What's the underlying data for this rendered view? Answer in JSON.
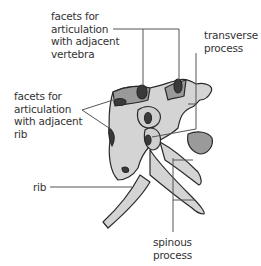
{
  "diagram": {
    "colors": {
      "bone_light": "#d4d4d4",
      "bone_mid": "#9a9a9a",
      "facet_dark": "#3a3a3a",
      "outline": "#2a2a2a",
      "leader_line": "#555555",
      "text": "#333333"
    },
    "labels": [
      {
        "id": "facets-vertebra",
        "text": "facets for\narticulation\nwith adjacent\nvertebra"
      },
      {
        "id": "transverse-process",
        "text": "transverse\nprocess"
      },
      {
        "id": "facets-rib",
        "text": "facets for\narticulation\nwith adjacent\nrib"
      },
      {
        "id": "rib",
        "text": "rib"
      },
      {
        "id": "spinous-process",
        "text": "spinous\nprocess"
      }
    ]
  }
}
